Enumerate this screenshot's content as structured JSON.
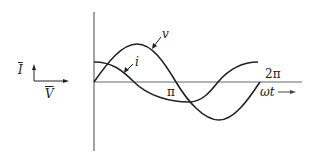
{
  "diagram": {
    "type": "waveform",
    "phasor": {
      "current_label": "I",
      "voltage_label": "V"
    },
    "waveforms": {
      "voltage_label": "v",
      "current_label": "i"
    },
    "axis": {
      "pi_label": "π",
      "two_pi_label": "2π",
      "x_label": "ωt"
    },
    "colors": {
      "stroke": "#222222",
      "axis": "#555555",
      "background": "#ffffff"
    }
  }
}
